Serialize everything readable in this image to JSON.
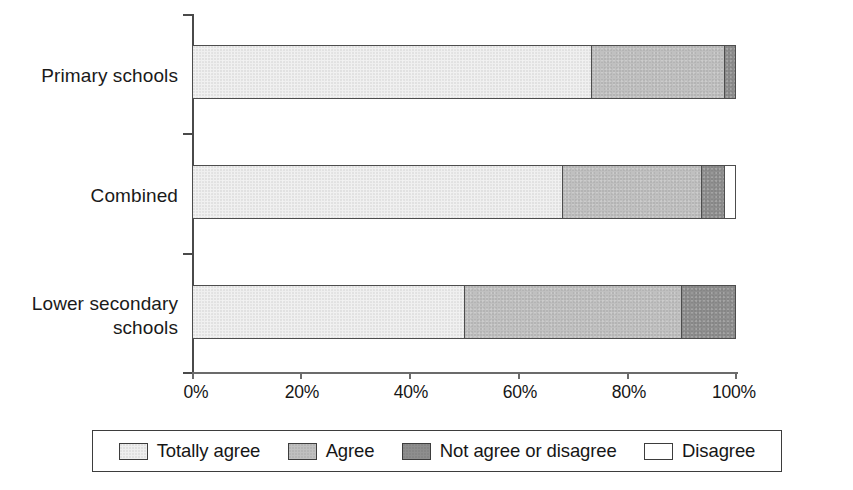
{
  "chart_data": {
    "type": "bar",
    "orientation": "horizontal",
    "stacked": true,
    "normalized_percent": true,
    "title": "",
    "subtitle": "",
    "xlabel": "",
    "ylabel": "",
    "xlim": [
      0,
      100
    ],
    "grid": false,
    "legend_position": "bottom",
    "categories": [
      "Primary schools",
      "Combined",
      "Lower secondary schools"
    ],
    "x_tick_labels": [
      "0%",
      "20%",
      "40%",
      "60%",
      "80%",
      "100%"
    ],
    "x_tick_values": [
      0,
      20,
      40,
      60,
      80,
      100
    ],
    "series": [
      {
        "name": "Totally agree",
        "color": "#efefef",
        "values": [
          73.5,
          68.0,
          50.0
        ]
      },
      {
        "name": "Agree",
        "color": "#c0c0c0",
        "values": [
          24.5,
          25.8,
          40.0
        ]
      },
      {
        "name": "Not agree or disagree",
        "color": "#8e8e8e",
        "values": [
          2.0,
          4.2,
          10.0
        ]
      },
      {
        "name": "Disagree",
        "color": "#ffffff",
        "values": [
          0.0,
          2.0,
          0.0
        ]
      }
    ],
    "annotations": []
  },
  "axis": {
    "x_ticks": [
      {
        "label": "0%",
        "value": 0
      },
      {
        "label": "20%",
        "value": 20
      },
      {
        "label": "40%",
        "value": 40
      },
      {
        "label": "60%",
        "value": 60
      },
      {
        "label": "80%",
        "value": 80
      },
      {
        "label": "100%",
        "value": 100
      }
    ]
  },
  "bars": [
    {
      "category": "Primary schools",
      "label_text": "Primary schools",
      "segments": [
        {
          "series": "Totally agree",
          "value": 73.5,
          "class": "seg-totally-agree"
        },
        {
          "series": "Agree",
          "value": 24.5,
          "class": "seg-agree"
        },
        {
          "series": "Not agree or disagree",
          "value": 2.0,
          "class": "seg-not-agree"
        }
      ]
    },
    {
      "category": "Combined",
      "label_text": "Combined",
      "segments": [
        {
          "series": "Totally agree",
          "value": 68.0,
          "class": "seg-totally-agree"
        },
        {
          "series": "Agree",
          "value": 25.8,
          "class": "seg-agree"
        },
        {
          "series": "Not agree or disagree",
          "value": 4.2,
          "class": "seg-not-agree"
        },
        {
          "series": "Disagree",
          "value": 2.0,
          "class": "seg-disagree"
        }
      ]
    },
    {
      "category": "Lower secondary schools",
      "label_text": "Lower secondary\nschools",
      "segments": [
        {
          "series": "Totally agree",
          "value": 50.0,
          "class": "seg-totally-agree"
        },
        {
          "series": "Agree",
          "value": 40.0,
          "class": "seg-agree"
        },
        {
          "series": "Not agree or disagree",
          "value": 10.0,
          "class": "seg-not-agree"
        }
      ]
    }
  ],
  "legend": {
    "items": [
      {
        "label": "Totally agree",
        "swatch_class": "seg-totally-agree",
        "color": "#efefef"
      },
      {
        "label": "Agree",
        "swatch_class": "seg-agree",
        "color": "#c0c0c0"
      },
      {
        "label": "Not agree or disagree",
        "swatch_class": "seg-not-agree",
        "color": "#8e8e8e"
      },
      {
        "label": "Disagree",
        "swatch_class": "seg-disagree",
        "color": "#ffffff"
      }
    ]
  }
}
